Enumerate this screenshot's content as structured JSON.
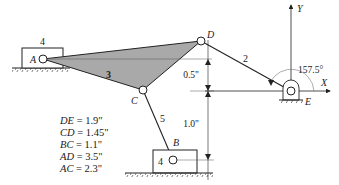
{
  "diagram": {
    "title": "",
    "links": {
      "ground_slider_top_label": "4",
      "coupler_label": "3",
      "crank_label": "2",
      "connecting_rod_label": "5",
      "ground_slider_bottom_label": "4"
    },
    "joints": {
      "A": "A",
      "B": "B",
      "C": "C",
      "D": "D",
      "E": "E"
    },
    "axes": {
      "x_label": "X",
      "y_label": "Y"
    },
    "angle_label": "157.5°",
    "dimensions": {
      "upper": "0.5\"",
      "lower": "1.0\""
    },
    "lengths": [
      {
        "symbol": "DE",
        "equals": " = ",
        "value": "1.9\""
      },
      {
        "symbol": "CD",
        "equals": " = ",
        "value": "1.45\""
      },
      {
        "symbol": "BC",
        "equals": " = ",
        "value": "1.1\""
      },
      {
        "symbol": "AD",
        "equals": " = ",
        "value": "3.5\""
      },
      {
        "symbol": "AC",
        "equals": " = ",
        "value": "2.3\""
      }
    ],
    "colors": {
      "coupler_fill": "#a9a9a9",
      "line": "#222222",
      "background": "#ffffff"
    }
  }
}
